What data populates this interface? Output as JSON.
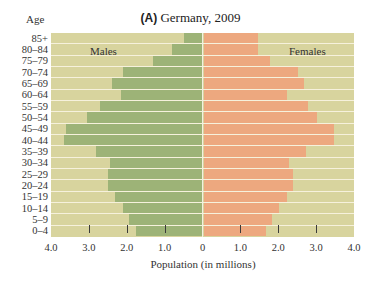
{
  "chart_data": {
    "type": "bar",
    "subtype": "population-pyramid",
    "title": "(A) Germany, 2009",
    "title_letter": "A",
    "title_text": " Germany, 2009",
    "ylabel": "Age",
    "xlabel": "Population (in millions)",
    "categories": [
      "85+",
      "80–84",
      "75–79",
      "70–74",
      "65–69",
      "60–64",
      "55–59",
      "50–54",
      "45–49",
      "40–44",
      "35–39",
      "30–34",
      "25–29",
      "20–24",
      "15–19",
      "10–14",
      "5–9",
      "0–4"
    ],
    "series": [
      {
        "name": "Males",
        "color": "#9db377",
        "values": [
          0.5,
          0.8,
          1.3,
          2.1,
          2.4,
          2.15,
          2.7,
          3.05,
          3.6,
          3.65,
          2.8,
          2.45,
          2.5,
          2.5,
          2.3,
          2.1,
          1.95,
          1.75
        ]
      },
      {
        "name": "Females",
        "color": "#eda87f",
        "values": [
          1.45,
          1.45,
          1.75,
          2.5,
          2.65,
          2.2,
          2.75,
          3.0,
          3.45,
          3.45,
          2.7,
          2.25,
          2.35,
          2.35,
          2.2,
          2.0,
          1.8,
          1.65
        ]
      }
    ],
    "xticks": [
      "4.0",
      "3.0",
      "2.0",
      "1.0",
      "0",
      "1.0",
      "2.0",
      "3.0",
      "4.0"
    ],
    "xlim": [
      -4.0,
      4.0
    ],
    "background_color": "#d8d49e",
    "legend": {
      "left_label": "Males",
      "right_label": "Females",
      "position": "inside-top"
    },
    "grid": false
  }
}
